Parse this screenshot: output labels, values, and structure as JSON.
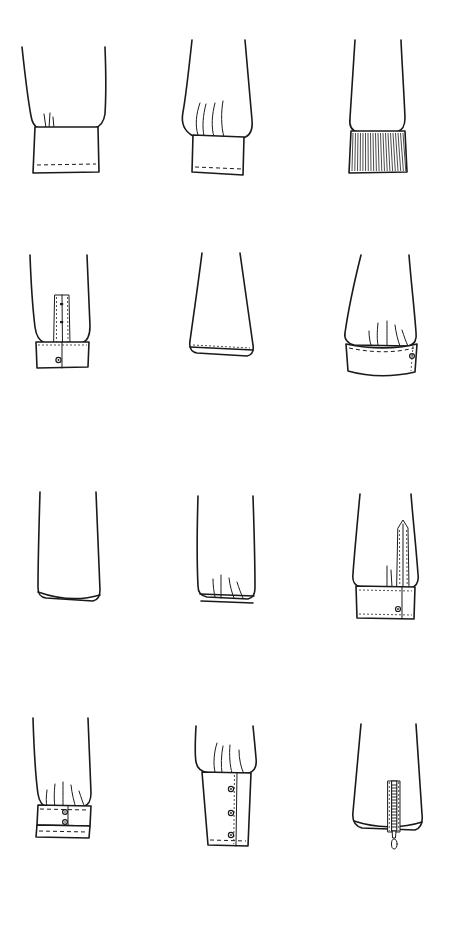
{
  "page": {
    "kind": "technical-fashion-sketch-sheet",
    "background_color": "#ffffff",
    "ink_color": "#1a1a1a",
    "width_px": 452,
    "height_px": 931,
    "columns": 3,
    "rows": 4,
    "figure_count": 12
  },
  "figures": [
    {
      "index": 1,
      "row": 1,
      "column": 1,
      "name": "straight-banded-cuff",
      "label": "Straight banded cuff",
      "description": "Tapered sleeve with small pleats gathered into a plain rectangular cuff band with topstitched hem.",
      "features": [
        "pleat",
        "cuff-band",
        "topstitch-hem"
      ],
      "buttons": 0,
      "closure": "none"
    },
    {
      "index": 2,
      "row": 1,
      "column": 2,
      "name": "pleated-banded-cuff",
      "label": "Pleated banded cuff",
      "description": "Wide sleeve with deep inverted pleats folding into a narrow straight cuff band, dashed topstitch along lower edge.",
      "features": [
        "deep-pleats",
        "cuff-band",
        "topstitch-hem"
      ],
      "buttons": 0,
      "closure": "none"
    },
    {
      "index": 3,
      "row": 1,
      "column": 3,
      "name": "ribbed-knit-cuff",
      "label": "Ribbed knit cuff",
      "description": "Straight sleeve ending in a dense vertical-ribbed knit band.",
      "features": [
        "rib-knit-band",
        "vertical-ribbing"
      ],
      "buttons": 0,
      "closure": "none"
    },
    {
      "index": 4,
      "row": 2,
      "column": 1,
      "name": "placket-cuff-single-button",
      "label": "Cuff with sleeve placket and single button",
      "description": "Tapered sleeve with a tower placket opening above a wide cuff, single button at cuff centre.",
      "features": [
        "tower-placket",
        "cuff-band",
        "stitch-outline"
      ],
      "buttons": 1,
      "closure": "button-placket"
    },
    {
      "index": 5,
      "row": 2,
      "column": 2,
      "name": "flared-hem-sleeve",
      "label": "Flared sleeve, plain hem",
      "description": "Wide A-line flared sleeve finished with a simple narrow turned-up topstitched hem.",
      "features": [
        "flare",
        "narrow-hem",
        "topstitch-hem"
      ],
      "buttons": 0,
      "closure": "none"
    },
    {
      "index": 6,
      "row": 2,
      "column": 3,
      "name": "gathered-cuff-side-button",
      "label": "Gathered cuff with side button",
      "description": "Sleeve gathered into a curved cuff band, stitched at top edge, button at the right side overlap.",
      "features": [
        "gathers",
        "curved-cuff",
        "edge-stitch"
      ],
      "buttons": 1,
      "closure": "button-overlap"
    },
    {
      "index": 7,
      "row": 3,
      "column": 1,
      "name": "plain-straight-sleeve",
      "label": "Plain straight sleeve",
      "description": "Straight sleeve with an open unfinished-looking rolled hem, no cuff.",
      "features": [
        "straight-sleeve",
        "rolled-hem"
      ],
      "buttons": 0,
      "closure": "none"
    },
    {
      "index": 8,
      "row": 3,
      "column": 2,
      "name": "elasticated-hem-sleeve",
      "label": "Elasticated hem sleeve",
      "description": "Straight sleeve with small gathers pulled into a narrow elasticated casing at the hem.",
      "features": [
        "gathers",
        "elastic-casing",
        "narrow-hem"
      ],
      "buttons": 0,
      "closure": "none"
    },
    {
      "index": 9,
      "row": 3,
      "column": 3,
      "name": "tower-placket-cuff",
      "label": "Shirt cuff with tower placket",
      "description": "Classic shirt sleeve with a pointed tower placket and a buttoned barrel cuff with overlap.",
      "features": [
        "pointed-tower-placket",
        "barrel-cuff",
        "overlap",
        "topstitch"
      ],
      "buttons": 1,
      "closure": "button-cuff"
    },
    {
      "index": 10,
      "row": 4,
      "column": 1,
      "name": "double-button-gathered-cuff",
      "label": "Gathered cuff, two buttons",
      "description": "Sleeve gathered into a deep cuff band with two stacked buttons and a stitched lower band.",
      "features": [
        "gathers",
        "deep-cuff",
        "double-band",
        "topstitch"
      ],
      "buttons": 2,
      "closure": "two-button-cuff"
    },
    {
      "index": 11,
      "row": 4,
      "column": 2,
      "name": "long-three-button-cuff",
      "label": "Long cuff with three buttons",
      "description": "Sleeve pleated into an extended gauntlet cuff fastened by three buttons down a vertical placket.",
      "features": [
        "pleats",
        "long-cuff",
        "vertical-placket",
        "topstitch-hem"
      ],
      "buttons": 3,
      "closure": "three-button-placket"
    },
    {
      "index": 12,
      "row": 4,
      "column": 3,
      "name": "zip-cuff-sleeve",
      "label": "Sleeve with zip opening",
      "description": "Tapered sleeve with a vertical zipper opening at the hem, pull tab hanging below the edge.",
      "features": [
        "zipper",
        "zip-teeth",
        "pull-tab",
        "stitch-tape"
      ],
      "buttons": 0,
      "closure": "zipper"
    }
  ]
}
